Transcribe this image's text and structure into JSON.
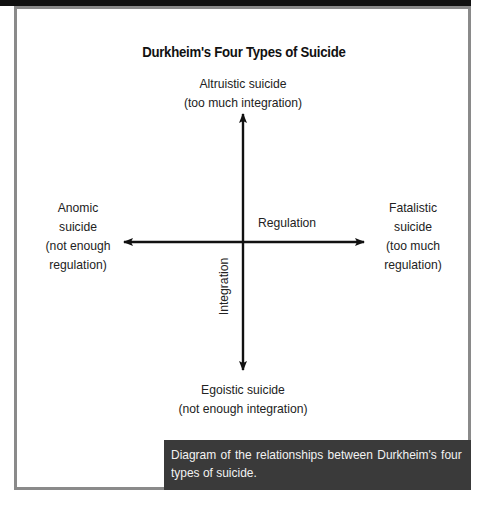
{
  "diagram": {
    "title": "Durkheim's Four Types of Suicide",
    "nodes": {
      "top": {
        "line1": "Altruistic suicide",
        "line2": "(too much integration)"
      },
      "bottom": {
        "line1": "Egoistic suicide",
        "line2": "(not enough integration)"
      },
      "left": {
        "line1": "Anomic",
        "line2": "suicide",
        "line3": "(not enough",
        "line4": "regulation)"
      },
      "right": {
        "line1": "Fatalistic",
        "line2": "suicide",
        "line3": "(too much",
        "line4": "regulation)"
      }
    },
    "axes": {
      "horizontal_label": "Regulation",
      "vertical_label": "Integration"
    },
    "colors": {
      "frame": "#8a8a8a",
      "caption_bg": "#3a3a3a",
      "caption_text": "#f2f2f2",
      "axis": "#111111"
    }
  },
  "caption": {
    "text": "Diagram of the relationships between Durkheim's four types of suicide."
  }
}
